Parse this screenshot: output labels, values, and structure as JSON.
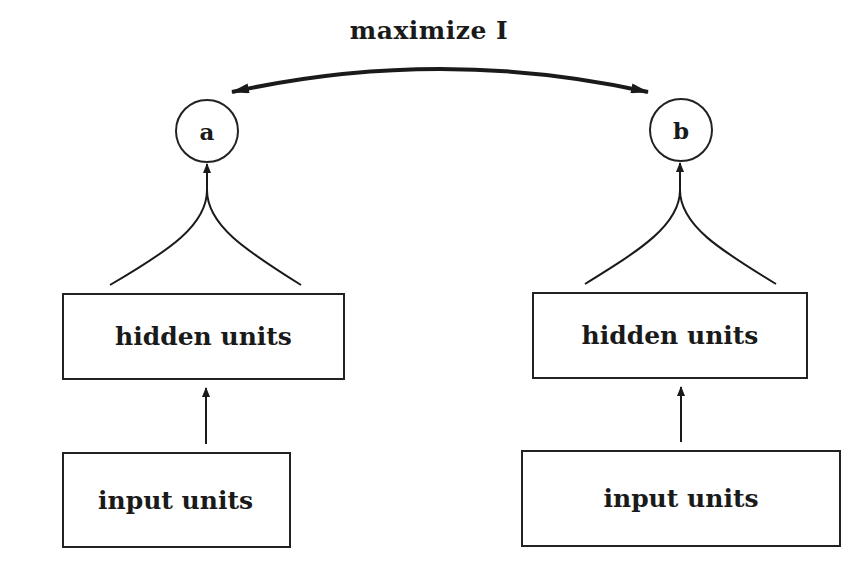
{
  "diagram": {
    "objective_label": "maximize I",
    "left_module": {
      "output_node": "a",
      "hidden_label": "hidden units",
      "input_label": "input units"
    },
    "right_module": {
      "output_node": "b",
      "hidden_label": "hidden units",
      "input_label": "input units"
    },
    "connections": [
      {
        "from": "a",
        "to": "b",
        "type": "double-arrow",
        "label": "maximize I"
      },
      {
        "from": "left_input",
        "to": "left_hidden",
        "type": "arrow"
      },
      {
        "from": "left_hidden",
        "to": "a",
        "type": "converging-arrow"
      },
      {
        "from": "right_input",
        "to": "right_hidden",
        "type": "arrow"
      },
      {
        "from": "right_hidden",
        "to": "b",
        "type": "converging-arrow"
      }
    ]
  }
}
